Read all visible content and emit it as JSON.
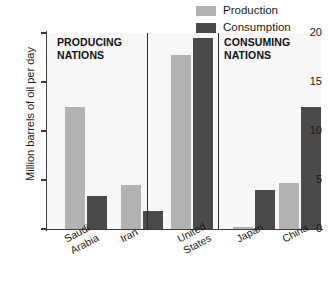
{
  "chart_data": {
    "type": "bar",
    "title": "",
    "xlabel": "",
    "ylabel": "Million barrels of oil per day",
    "ylim": [
      0,
      20
    ],
    "yticks": [
      "0",
      "5",
      "10",
      "15",
      "20"
    ],
    "grid": false,
    "legend_position": "top-right",
    "categories": [
      "Saudi Arabia",
      "Iran",
      "United States",
      "Japan",
      "China"
    ],
    "series": [
      {
        "name": "Production",
        "color": "#b2b2b2",
        "values": [
          12.4,
          4.5,
          17.8,
          0.2,
          4.7
        ]
      },
      {
        "name": "Consumption",
        "color": "#4a4a4a",
        "values": [
          3.4,
          1.8,
          19.5,
          4.0,
          12.5
        ]
      }
    ],
    "annotations": [
      {
        "text": "PRODUCING\nNATIONS",
        "panel": 0
      },
      {
        "text": "CONSUMING\nNATIONS",
        "panel": 2
      }
    ],
    "panels": [
      {
        "label": "PRODUCING NATIONS",
        "categories": [
          "Saudi Arabia",
          "Iran"
        ]
      },
      {
        "label": "",
        "categories": [
          "United States"
        ]
      },
      {
        "label": "CONSUMING NATIONS",
        "categories": [
          "Japan",
          "China"
        ]
      }
    ]
  },
  "legend": {
    "items": [
      {
        "label": "Production",
        "swatch_name": "legend-swatch-production"
      },
      {
        "label": "Consumption",
        "swatch_name": "legend-swatch-consumption"
      }
    ]
  },
  "axis": {
    "y_title": "Million barrels of oil per day",
    "ticks": [
      {
        "value": 20,
        "label": "20"
      },
      {
        "value": 15,
        "label": "15"
      },
      {
        "value": 10,
        "label": "10"
      },
      {
        "value": 5,
        "label": "5"
      },
      {
        "value": 0,
        "label": "0"
      }
    ]
  },
  "sections": [
    {
      "title": "PRODUCING\nNATIONS"
    },
    {
      "title": "CONSUMING\nNATIONS"
    }
  ],
  "xlabels": [
    {
      "text": "Saudi\nArabia"
    },
    {
      "text": "Iran"
    },
    {
      "text": "United\nStates"
    },
    {
      "text": "Japan"
    },
    {
      "text": "China"
    }
  ]
}
